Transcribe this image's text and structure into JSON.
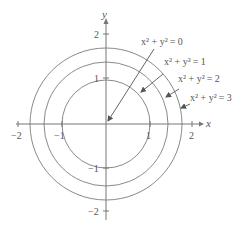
{
  "diagram": {
    "axes": {
      "x_label": "x",
      "y_label": "y",
      "x_ticks": [
        {
          "value": -2,
          "label": "−2"
        },
        {
          "value": -1,
          "label": "−1"
        },
        {
          "value": 1,
          "label": "1"
        },
        {
          "value": 2,
          "label": "2"
        }
      ],
      "y_ticks": [
        {
          "value": 2,
          "label": "2"
        },
        {
          "value": 1,
          "label": "1"
        },
        {
          "value": -1,
          "label": "−1"
        },
        {
          "value": -2,
          "label": "−2"
        }
      ]
    },
    "curves": [
      {
        "c": 0,
        "radius": 0,
        "label_lhs": "x² + y²",
        "label_rhs": "= 0"
      },
      {
        "c": 1,
        "radius": 1,
        "label_lhs": "x² + y²",
        "label_rhs": "= 1"
      },
      {
        "c": 2,
        "radius": 1.414,
        "label_lhs": "x² + y²",
        "label_rhs": "= 2"
      },
      {
        "c": 3,
        "radius": 1.732,
        "label_lhs": "x² + y²",
        "label_rhs": "= 3"
      }
    ],
    "colors": {
      "curve": "#8a8a8a",
      "axis": "#777777",
      "text": "#555555"
    }
  }
}
